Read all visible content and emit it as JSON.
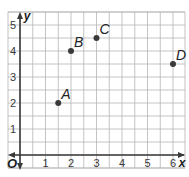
{
  "chart_data": {
    "type": "scatter",
    "title": "",
    "xlabel": "x",
    "ylabel": "y",
    "origin_label": "O",
    "xlim": [
      -0.5,
      6.5
    ],
    "ylim": [
      0,
      5.5
    ],
    "grid": true,
    "grid_step": 0.5,
    "x_ticks": [
      "1",
      "2",
      "3",
      "4",
      "5",
      "6"
    ],
    "y_ticks": [
      "1",
      "2",
      "3",
      "4",
      "5"
    ],
    "points": [
      {
        "label": "A",
        "x": 1.5,
        "y": 2
      },
      {
        "label": "B",
        "x": 2,
        "y": 4
      },
      {
        "label": "C",
        "x": 3,
        "y": 4.5
      },
      {
        "label": "D",
        "x": 6,
        "y": 3.5
      }
    ]
  },
  "colors": {
    "grid": "#b5b5b5",
    "axis": "#3a3a3a",
    "point": "#3a3a3a"
  }
}
